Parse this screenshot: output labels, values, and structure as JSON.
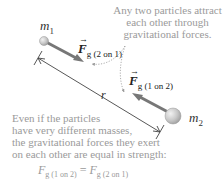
{
  "masses": {
    "m1": {
      "symbol": "m",
      "subscript": "1"
    },
    "m2": {
      "symbol": "m",
      "subscript": "2"
    }
  },
  "forces": {
    "f21": {
      "symbol": "F",
      "subscript": "g (2 on 1)"
    },
    "f12": {
      "symbol": "F",
      "subscript": "g (1 on 2)"
    }
  },
  "distance": {
    "symbol": "r"
  },
  "callouts": {
    "top_right": [
      "Any two particles attract",
      "each other through",
      "gravitational forces."
    ],
    "bottom_left": [
      "Even if the particles",
      "have very different masses,",
      "the gravitational forces they exert",
      "on each other are equal in strength:"
    ]
  },
  "equation": {
    "lhs_symbol": "F",
    "lhs_subscript": "g (1 on 2)",
    "operator": "=",
    "rhs_symbol": "F",
    "rhs_subscript": "g (2 on 1)"
  },
  "colors": {
    "force_arrow": "#777777",
    "sphere_fill": "#c8c8c8",
    "callout_text": "#9a9a9a",
    "leader_line": "#999999"
  }
}
